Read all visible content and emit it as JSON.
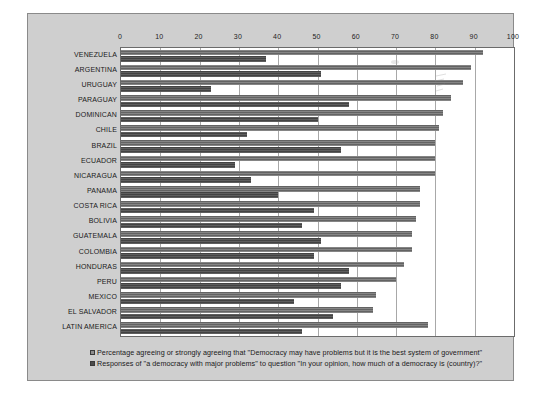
{
  "chart_data": {
    "type": "bar",
    "orientation": "horizontal",
    "title": "",
    "xlabel": "",
    "ylabel": "",
    "xlim": [
      0,
      100
    ],
    "xticks": [
      0,
      10,
      20,
      30,
      40,
      50,
      60,
      70,
      80,
      90,
      100
    ],
    "grid": true,
    "legend_position": "bottom",
    "categories": [
      "VENEZUELA",
      "ARGENTINA",
      "URUGUAY",
      "PARAGUAY",
      "DOMINICAN",
      "CHILE",
      "BRAZIL",
      "ECUADOR",
      "NICARAGUA",
      "PANAMA",
      "COSTA RICA",
      "BOLIVIA",
      "GUATEMALA",
      "COLOMBIA",
      "HONDURAS",
      "PERU",
      "MEXICO",
      "EL SALVADOR",
      "LATIN AMERICA"
    ],
    "series": [
      {
        "name": "Percentage agreeing or strongly agreeing that \"Democracy may have problems but it is the best system of government\"",
        "color": "#6e6e6e",
        "values": [
          92,
          89,
          87,
          84,
          82,
          81,
          80,
          80,
          80,
          76,
          76,
          75,
          74,
          74,
          72,
          70,
          65,
          64,
          78
        ]
      },
      {
        "name": "Responses of \"a democracy with major problems\" to question \"In your opinion, how much of a democracy is (country)?\"",
        "color": "#4c4c4c",
        "values": [
          37,
          51,
          23,
          58,
          50,
          32,
          56,
          29,
          33,
          40,
          49,
          46,
          51,
          49,
          58,
          56,
          44,
          54,
          46
        ]
      }
    ]
  },
  "legend": {
    "entries": [
      {
        "swatch": "series-1-swatch",
        "label": "Percentage agreeing or strongly agreeing that \"Democracy may have problems but it is the best system of government\""
      },
      {
        "swatch": "series-2-swatch",
        "label": "Responses of \"a democracy with major problems\" to question \"In your opinion, how much of a democracy is (country)?\""
      }
    ]
  }
}
